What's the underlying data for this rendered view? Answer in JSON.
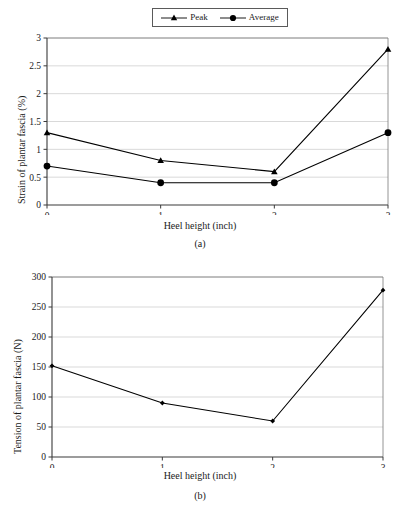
{
  "figure": {
    "legend": {
      "entries": [
        {
          "label": "Peak",
          "marker": "triangle-marker-icon",
          "color": "#000000"
        },
        {
          "label": "Average",
          "marker": "circle-marker-icon",
          "color": "#000000"
        }
      ]
    },
    "panels": [
      {
        "caption": "(a)"
      },
      {
        "caption": "(b)"
      }
    ]
  },
  "chart_data": [
    {
      "type": "line",
      "title": "",
      "xlabel": "Heel height (inch)",
      "ylabel": "Strain of plantar fascia (%)",
      "caption": "(a)",
      "x": [
        0,
        1,
        2,
        3
      ],
      "xticklabels": [
        "0",
        "1",
        "2",
        "3"
      ],
      "xlim": [
        0,
        3
      ],
      "ylim": [
        0,
        3
      ],
      "yticks": [
        0,
        0.5,
        1,
        1.5,
        2,
        2.5,
        3
      ],
      "yticklabels": [
        "0",
        "0.5",
        "1",
        "1.5",
        "2",
        "2.5",
        "3"
      ],
      "grid": "horizontal",
      "legend_position": "above-plot",
      "series": [
        {
          "name": "Peak",
          "marker": "triangle",
          "color": "#000000",
          "values": [
            1.3,
            0.8,
            0.6,
            2.8
          ]
        },
        {
          "name": "Average",
          "marker": "circle",
          "color": "#000000",
          "values": [
            0.7,
            0.4,
            0.4,
            1.3
          ]
        }
      ]
    },
    {
      "type": "line",
      "title": "",
      "xlabel": "Heel height (inch)",
      "ylabel": "Tension of plantar fascia (N)",
      "caption": "(b)",
      "x": [
        0,
        1,
        2,
        3
      ],
      "xticklabels": [
        "0",
        "1",
        "2",
        "3"
      ],
      "xlim": [
        0,
        3
      ],
      "ylim": [
        0,
        300
      ],
      "yticks": [
        0,
        50,
        100,
        150,
        200,
        250,
        300
      ],
      "yticklabels": [
        "0",
        "50",
        "100",
        "150",
        "200",
        "250",
        "300"
      ],
      "grid": "horizontal",
      "legend_position": "none",
      "series": [
        {
          "name": "Tension",
          "marker": "diamond-small",
          "color": "#000000",
          "values": [
            152,
            90,
            60,
            278
          ]
        }
      ]
    }
  ]
}
